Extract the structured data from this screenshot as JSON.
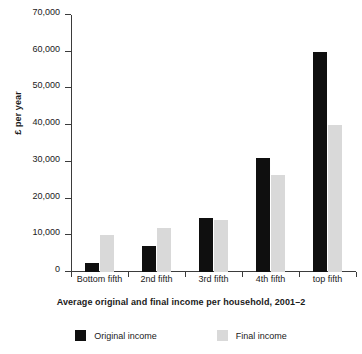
{
  "chart_data": {
    "type": "bar",
    "title": "",
    "subtitle": "",
    "caption": "Average original and final income per household, 2001–2",
    "xlabel": "",
    "ylabel": "£ per year",
    "categories": [
      "Bottom fifth",
      "2nd fifth",
      "3rd fifth",
      "4th fifth",
      "top fifth"
    ],
    "series": [
      {
        "name": "Original income",
        "color": "#0f0f0f",
        "values": [
          2500,
          7000,
          14700,
          31000,
          60000
        ]
      },
      {
        "name": "Final income",
        "color": "#d9d9d9",
        "values": [
          10000,
          12000,
          14300,
          26500,
          40000
        ]
      }
    ],
    "ylim": [
      0,
      70000
    ],
    "ytick_values": [
      0,
      10000,
      20000,
      30000,
      40000,
      50000,
      60000,
      70000
    ],
    "ytick_labels": [
      "0",
      "10,000",
      "20,000",
      "30,000",
      "40,000",
      "50,000",
      "60,000",
      "70,000"
    ],
    "grid": false,
    "legend_position": "bottom"
  }
}
